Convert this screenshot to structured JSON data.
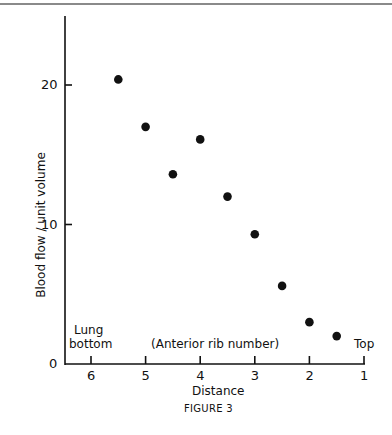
{
  "chart_data": {
    "type": "scatter",
    "title": "",
    "caption": "FIGURE 3",
    "xlabel": "Distance",
    "xlabel_sub": "(Anterior rib number)",
    "ylabel": "Blood flow / unit volume",
    "x_ticks": [
      "6",
      "5",
      "4",
      "3",
      "2",
      "1"
    ],
    "y_ticks": [
      "0",
      "10",
      "20"
    ],
    "xlim": [
      6.5,
      1
    ],
    "ylim": [
      0,
      25
    ],
    "x_reversed": true,
    "grid": false,
    "annotations": {
      "left": [
        "Lung",
        "bottom"
      ],
      "right": "Top"
    },
    "series": [
      {
        "name": "Blood flow",
        "marker": "filled-circle",
        "color": "#111111",
        "points": [
          {
            "x": 5.5,
            "y": 20.4
          },
          {
            "x": 5.0,
            "y": 17.0
          },
          {
            "x": 4.5,
            "y": 13.6
          },
          {
            "x": 4.0,
            "y": 16.1
          },
          {
            "x": 3.5,
            "y": 12.0
          },
          {
            "x": 3.0,
            "y": 9.3
          },
          {
            "x": 2.5,
            "y": 5.6
          },
          {
            "x": 2.0,
            "y": 3.0
          },
          {
            "x": 1.5,
            "y": 2.0
          }
        ]
      }
    ]
  }
}
